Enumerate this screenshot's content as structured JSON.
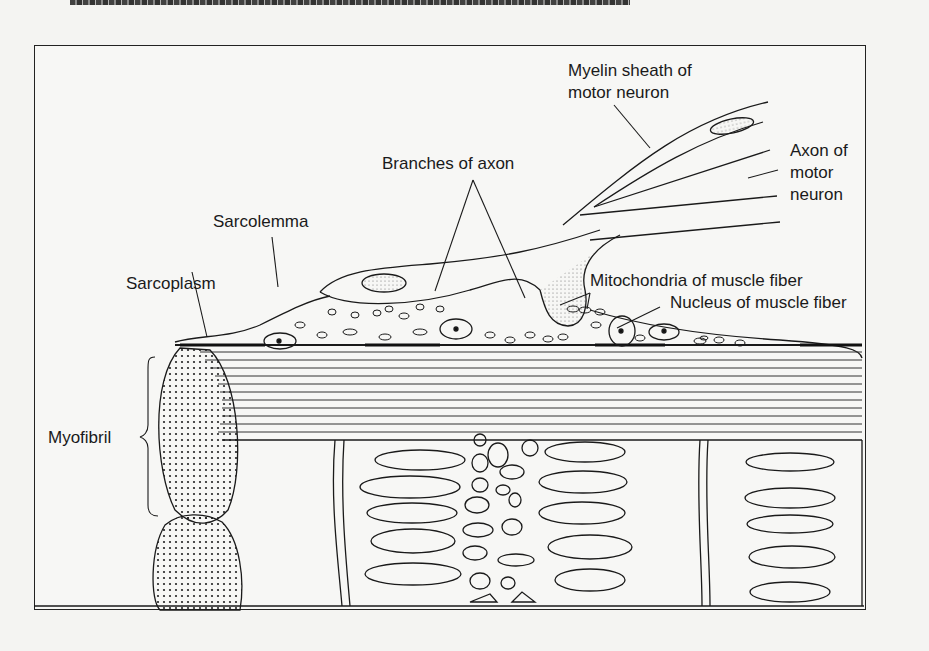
{
  "page": {
    "header_fragment": "The fine structure of skeletal muscle (partially cut off)"
  },
  "figure": {
    "labels": {
      "myelin_sheath": [
        "Myelin sheath of",
        "motor neuron"
      ],
      "axon": [
        "Axon of",
        "motor",
        "neuron"
      ],
      "branches_of_axon": "Branches of axon",
      "sarcolemma": "Sarcolemma",
      "sarcoplasm": "Sarcoplasm",
      "mitochondria": "Mitochondria of muscle fiber",
      "nucleus": "Nucleus of muscle fiber",
      "myofibril": "Myofibril"
    },
    "colors": {
      "ink": "#1a1a1a",
      "paper": "#f7f7f5"
    }
  }
}
